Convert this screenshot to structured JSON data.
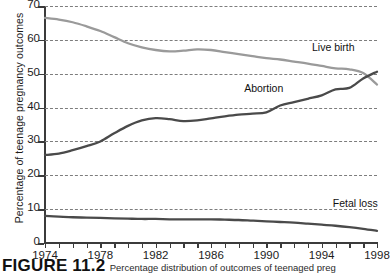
{
  "figure": {
    "caption_label": "FIGURE 11.2",
    "caption_text": "Percentage distribution of outcomes of teenaged preg"
  },
  "chart_data": {
    "type": "line",
    "title": "",
    "xlabel": "",
    "ylabel": "Percentage of teenage pregnancy outcomes",
    "xlim": [
      1974,
      1998
    ],
    "ylim": [
      0,
      70
    ],
    "grid": "horizontal-dashed",
    "legend": "inline-annotations",
    "ytick_labels": [
      "0",
      "10",
      "20",
      "30",
      "40",
      "50",
      "60",
      "70"
    ],
    "ytick_values": [
      0,
      10,
      20,
      30,
      40,
      50,
      60,
      70
    ],
    "xtick_labels": [
      "1974",
      "1978",
      "1982",
      "1986",
      "1990",
      "1994",
      "1998"
    ],
    "xtick_values": [
      1974,
      1978,
      1982,
      1986,
      1990,
      1994,
      1998
    ],
    "x": [
      1974,
      1975,
      1976,
      1977,
      1978,
      1979,
      1980,
      1981,
      1982,
      1983,
      1984,
      1985,
      1986,
      1987,
      1988,
      1989,
      1990,
      1991,
      1992,
      1993,
      1994,
      1995,
      1996,
      1997,
      1998
    ],
    "series": [
      {
        "name": "Live birth",
        "color": "#9a9a9a",
        "values": [
          66.5,
          66.0,
          65.2,
          64.0,
          62.6,
          60.8,
          59.0,
          57.8,
          57.0,
          56.6,
          56.8,
          57.2,
          57.0,
          56.4,
          55.8,
          55.2,
          54.6,
          54.2,
          53.6,
          53.0,
          52.3,
          51.6,
          51.3,
          50.2,
          46.8
        ]
      },
      {
        "name": "Abortion",
        "color": "#4a4a4a",
        "values": [
          26.0,
          26.4,
          27.4,
          28.6,
          30.0,
          32.4,
          34.6,
          36.2,
          36.9,
          36.6,
          36.0,
          36.2,
          36.8,
          37.4,
          37.9,
          38.2,
          38.6,
          40.6,
          41.6,
          42.6,
          43.6,
          45.4,
          45.8,
          48.6,
          50.6
        ]
      },
      {
        "name": "Fetal loss",
        "color": "#4a4a4a",
        "values": [
          8.0,
          7.8,
          7.6,
          7.5,
          7.4,
          7.3,
          7.2,
          7.1,
          7.1,
          7.0,
          7.0,
          7.0,
          7.0,
          6.9,
          6.8,
          6.6,
          6.4,
          6.2,
          6.0,
          5.7,
          5.4,
          5.1,
          4.7,
          4.2,
          3.6
        ]
      }
    ],
    "annotations": [
      {
        "name": "Live birth",
        "x": 1993.3,
        "y": 57.5
      },
      {
        "name": "Abortion",
        "x": 1988.4,
        "y": 45.5
      },
      {
        "name": "Fetal loss",
        "x": 1994.8,
        "y": 11.5
      }
    ]
  }
}
